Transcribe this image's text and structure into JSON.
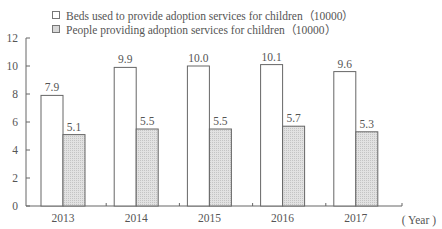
{
  "legend": {
    "series_1": "Beds used to provide adoption services for children（10000）",
    "series_2": "People providing adoption services for children（10000）"
  },
  "axis": {
    "x_unit": "( Year )",
    "y_ticks": [
      "0",
      "2",
      "4",
      "6",
      "8",
      "10",
      "12"
    ]
  },
  "colors": {
    "series_1_fill": "#ffffff",
    "series_2_fill": "#d8d8d8",
    "stroke": "#666666"
  },
  "chart_data": {
    "type": "bar",
    "title": "",
    "xlabel": "( Year )",
    "ylabel": "",
    "ylim": [
      0,
      12
    ],
    "yticks": [
      0,
      2,
      4,
      6,
      8,
      10,
      12
    ],
    "grid": false,
    "legend_position": "top",
    "categories": [
      "2013",
      "2014",
      "2015",
      "2016",
      "2017"
    ],
    "series": [
      {
        "name": "Beds used to provide adoption services for children（10000）",
        "values": [
          7.9,
          9.9,
          10.0,
          10.1,
          9.6
        ],
        "labels": [
          "7.9",
          "9.9",
          "10.0",
          "10.1",
          "9.6"
        ]
      },
      {
        "name": "People providing adoption services for children（10000）",
        "values": [
          5.1,
          5.5,
          5.5,
          5.7,
          5.3
        ],
        "labels": [
          "5.1",
          "5.5",
          "5.5",
          "5.7",
          "5.3"
        ]
      }
    ]
  }
}
